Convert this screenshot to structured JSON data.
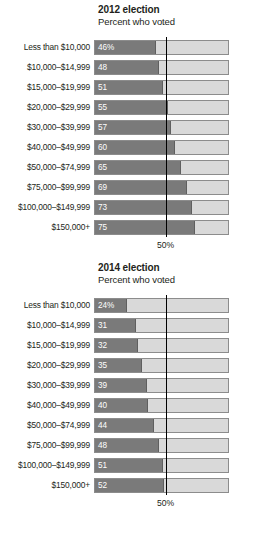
{
  "chart_data": [
    {
      "type": "bar",
      "orientation": "horizontal",
      "title": "2012 election",
      "subtitle": "Percent who voted",
      "xlabel": "",
      "ylabel": "",
      "xlim": [
        0,
        100
      ],
      "grid": false,
      "legend": "none",
      "reference_line": {
        "value": 50,
        "label": "50%"
      },
      "categories": [
        "Less than $10,000",
        "$10,000–$14,999",
        "$15,000–$19,999",
        "$20,000–$29,999",
        "$30,000–$39,999",
        "$40,000–$49,999",
        "$50,000–$74,999",
        "$75,000–$99,999",
        "$100,000–$149,999",
        "$150,000+"
      ],
      "values": [
        46,
        48,
        51,
        55,
        57,
        60,
        65,
        69,
        73,
        75
      ],
      "value_labels": [
        "46%",
        "48",
        "51",
        "55",
        "57",
        "60",
        "65",
        "69",
        "73",
        "75"
      ],
      "colors": {
        "fill": "#7a7a7a",
        "track": "#d9d9d9",
        "line": "#000000"
      }
    },
    {
      "type": "bar",
      "orientation": "horizontal",
      "title": "2014 election",
      "subtitle": "Percent who voted",
      "xlabel": "",
      "ylabel": "",
      "xlim": [
        0,
        100
      ],
      "grid": false,
      "legend": "none",
      "reference_line": {
        "value": 50,
        "label": "50%"
      },
      "categories": [
        "Less than $10,000",
        "$10,000–$14,999",
        "$15,000–$19,999",
        "$20,000–$29,999",
        "$30,000–$39,999",
        "$40,000–$49,999",
        "$50,000–$74,999",
        "$75,000–$99,999",
        "$100,000–$149,999",
        "$150,000+"
      ],
      "values": [
        24,
        31,
        32,
        35,
        39,
        40,
        44,
        48,
        51,
        52
      ],
      "value_labels": [
        "24%",
        "31",
        "32",
        "35",
        "39",
        "40",
        "44",
        "48",
        "51",
        "52"
      ],
      "colors": {
        "fill": "#7a7a7a",
        "track": "#d9d9d9",
        "line": "#000000"
      }
    }
  ]
}
